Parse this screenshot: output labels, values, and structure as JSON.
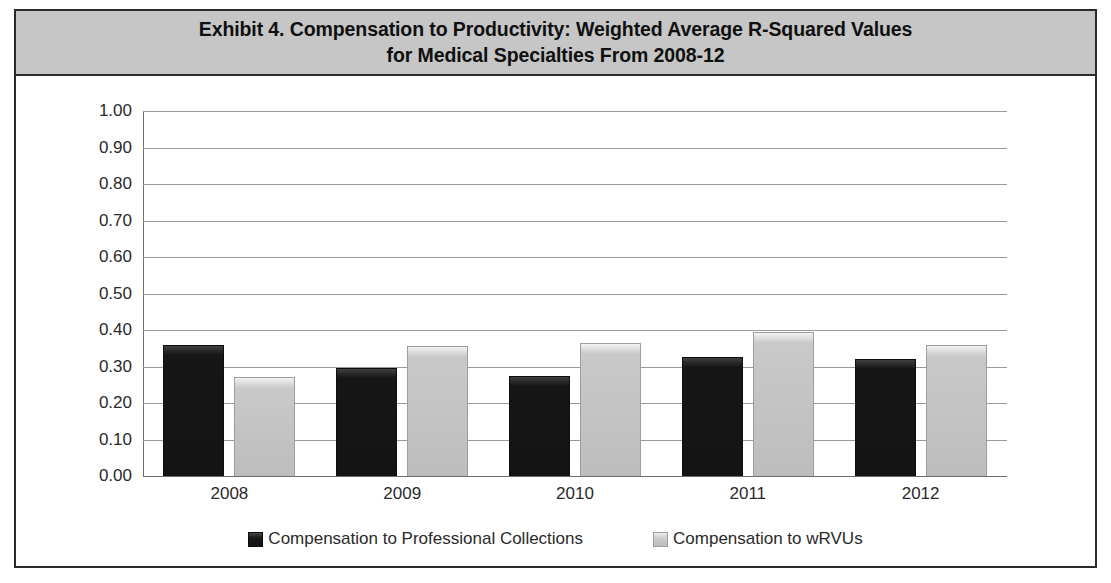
{
  "exhibit": {
    "title": "Exhibit 4. Compensation to Productivity: Weighted Average R-Squared Values\nfor Medical Specialties From 2008-12"
  },
  "colors": {
    "title_band_background": "#c6c6c6",
    "frame_border": "#2b2b2b",
    "series_dark": "#141414",
    "series_light": "#bdbdbd",
    "gridline": "#9a9a9a",
    "text": "#2a2a2a"
  },
  "chart_data": {
    "type": "bar",
    "title": "Exhibit 4. Compensation to Productivity: Weighted Average R-Squared Values for Medical Specialties From 2008-12",
    "xlabel": "",
    "ylabel": "",
    "categories": [
      "2008",
      "2009",
      "2010",
      "2011",
      "2012"
    ],
    "series": [
      {
        "name": "Compensation to Professional Collections",
        "color": "#141414",
        "values": [
          0.36,
          0.295,
          0.275,
          0.325,
          0.32
        ]
      },
      {
        "name": "Compensation to wRVUs",
        "color": "#bdbdbd",
        "values": [
          0.27,
          0.355,
          0.365,
          0.395,
          0.36
        ]
      }
    ],
    "ylim": [
      0.0,
      1.0
    ],
    "ytick_step": 0.1,
    "ytick_labels": [
      "1.00",
      "0.90",
      "0.80",
      "0.70",
      "0.60",
      "0.50",
      "0.40",
      "0.30",
      "0.20",
      "0.10",
      "0.00"
    ],
    "ytick_values": [
      1.0,
      0.9,
      0.8,
      0.7,
      0.6,
      0.5,
      0.4,
      0.3,
      0.2,
      0.1,
      0.0
    ],
    "grid": true,
    "legend_position": "bottom"
  }
}
